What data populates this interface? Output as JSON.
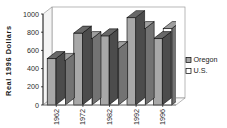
{
  "chart_data": {
    "type": "bar",
    "title": "",
    "subtitle": "",
    "xlabel": "",
    "ylabel": "Real 1996 Dollars",
    "categories": [
      "1962",
      "1972",
      "1982",
      "1992",
      "1996"
    ],
    "series": [
      {
        "name": "Oregon",
        "values": [
          510,
          790,
          760,
          960,
          730
        ],
        "color": "#a8a8a8"
      },
      {
        "name": "U.S.",
        "values": [
          490,
          730,
          620,
          840,
          840
        ],
        "color": "#ffffff"
      }
    ],
    "ylim": [
      0,
      1000
    ],
    "ytick_labels": [
      "0",
      "200",
      "400",
      "600",
      "800",
      "1000"
    ],
    "ytick_values": [
      0,
      200,
      400,
      600,
      800,
      1000
    ],
    "grid": false,
    "legend_position": "right",
    "style": "3d-column",
    "axis_color": "#000000",
    "plot_background": "#ffffff",
    "xtick_label_rotation": -90
  },
  "legend": {
    "entries": [
      {
        "label": "Oregon",
        "swatch": "#a8a8a8"
      },
      {
        "label": "U.S.",
        "swatch": "#ffffff"
      }
    ]
  }
}
